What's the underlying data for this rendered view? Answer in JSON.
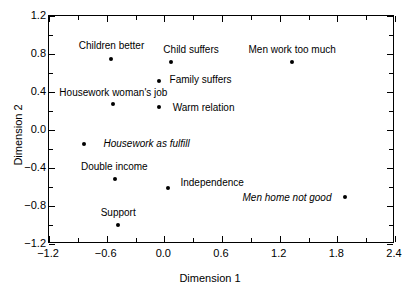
{
  "chart_data": {
    "type": "scatter",
    "title": "",
    "xlabel": "Dimension 1",
    "ylabel": "Dimension 2",
    "xlim": [
      -1.2,
      2.4
    ],
    "ylim": [
      -1.2,
      1.2
    ],
    "xticks": [
      "-1.2",
      "-0.6",
      "0.0",
      "0.6",
      "1.2",
      "1.8",
      "2.4"
    ],
    "xtick_values": [
      -1.2,
      -0.6,
      0.0,
      0.6,
      1.2,
      1.8,
      2.4
    ],
    "yticks": [
      "1.2",
      "0.8",
      "0.4",
      "0.0",
      "-0.4",
      "-0.8",
      "-1.2"
    ],
    "ytick_values": [
      1.2,
      0.8,
      0.4,
      0.0,
      -0.4,
      -0.8,
      -1.2
    ],
    "grid": false,
    "legend": "none",
    "points": [
      {
        "label": "Children better",
        "x": -0.55,
        "y": 0.75,
        "italic": false,
        "label_dx": 0,
        "label_dy": -14
      },
      {
        "label": "Child suffers",
        "x": 0.07,
        "y": 0.72,
        "italic": false,
        "label_dx": 20,
        "label_dy": -13
      },
      {
        "label": "Family suffers",
        "x": -0.06,
        "y": 0.52,
        "italic": false,
        "label_dx": 42,
        "label_dy": -2
      },
      {
        "label": "Housework woman's job",
        "x": -0.53,
        "y": 0.27,
        "italic": false,
        "label_dx": 0,
        "label_dy": -12
      },
      {
        "label": "Warm relation",
        "x": -0.06,
        "y": 0.24,
        "italic": false,
        "label_dx": 45,
        "label_dy": 0
      },
      {
        "label": "Housework as fulfill",
        "x": -0.84,
        "y": -0.15,
        "italic": true,
        "label_dx": 63,
        "label_dy": -1
      },
      {
        "label": "Double income",
        "x": -0.51,
        "y": -0.52,
        "italic": false,
        "label_dx": -1,
        "label_dy": -13
      },
      {
        "label": "Independence",
        "x": 0.04,
        "y": -0.61,
        "italic": false,
        "label_dx": 44,
        "label_dy": -6
      },
      {
        "label": "Support",
        "x": -0.48,
        "y": -1.0,
        "italic": false,
        "label_dx": 0,
        "label_dy": -13
      },
      {
        "label": "Men work too much",
        "x": 1.33,
        "y": 0.72,
        "italic": false,
        "label_dx": 0,
        "label_dy": -13
      },
      {
        "label": "Men home not good",
        "x": 1.88,
        "y": -0.71,
        "italic": true,
        "label_dx": -58,
        "label_dy": 0
      }
    ]
  }
}
